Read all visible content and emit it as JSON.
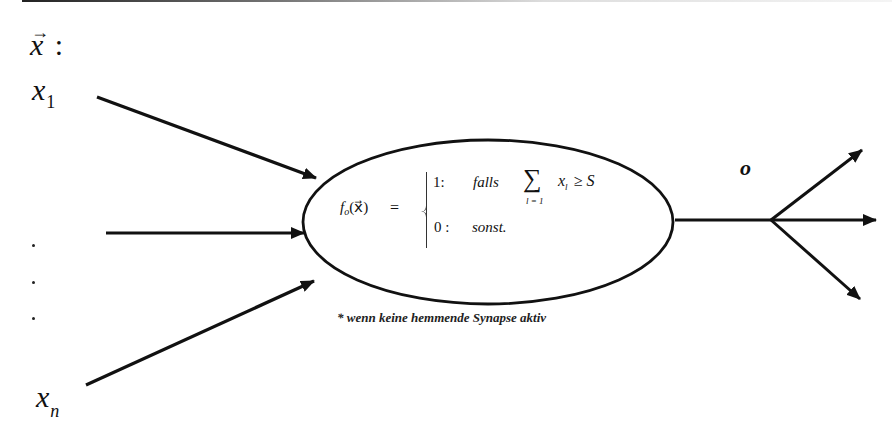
{
  "diagram": {
    "type": "threshold-neuron",
    "input_vector_label": "x",
    "input_vector_suffix": ":",
    "inputs": {
      "first": {
        "base": "x",
        "sub": "1"
      },
      "last": {
        "base": "x",
        "sub": "n"
      },
      "ellipsis_dots": 3
    },
    "function": {
      "name": "f",
      "name_sub": "o",
      "arg": "(x⃗)",
      "equals": "=",
      "case_true_value": "1:",
      "case_true_condition": "falls",
      "sum_symbol": "∑",
      "sum_index": "l = 1",
      "sum_term": "x",
      "sum_term_sub": "l",
      "comparison": "≥ S",
      "case_false_value": "0 :",
      "case_false_condition": "sonst."
    },
    "footnote": "* wenn keine hemmende Synapse aktiv",
    "output_label": "o",
    "colors": {
      "stroke": "#111111",
      "background": "#ffffff"
    }
  }
}
